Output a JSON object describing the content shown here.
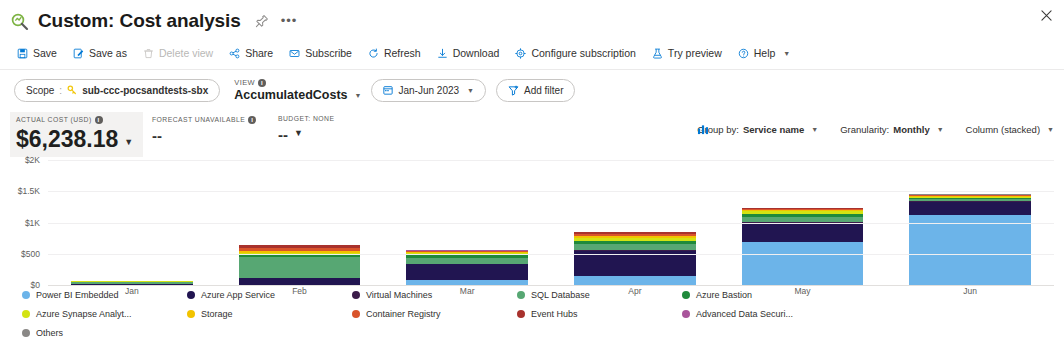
{
  "header": {
    "icon": "cost-analysis-icon",
    "title": "Custom: Cost analysis",
    "pin_icon": "pin-icon",
    "more_icon": "ellipsis-icon",
    "close_icon": "close-icon"
  },
  "command_bar": {
    "items": [
      {
        "label": "Save",
        "icon": "save-icon",
        "disabled": false,
        "caret": false
      },
      {
        "label": "Save as",
        "icon": "save-as-icon",
        "disabled": false,
        "caret": false
      },
      {
        "label": "Delete view",
        "icon": "delete-icon",
        "disabled": true,
        "caret": false
      },
      {
        "label": "Share",
        "icon": "share-icon",
        "disabled": false,
        "caret": false
      },
      {
        "label": "Subscribe",
        "icon": "mail-icon",
        "disabled": false,
        "caret": false
      },
      {
        "label": "Refresh",
        "icon": "refresh-icon",
        "disabled": false,
        "caret": false
      },
      {
        "label": "Download",
        "icon": "download-icon",
        "disabled": false,
        "caret": false
      },
      {
        "label": "Configure subscription",
        "icon": "gear-icon",
        "disabled": false,
        "caret": false
      },
      {
        "label": "Try preview",
        "icon": "beaker-icon",
        "disabled": false,
        "caret": false
      },
      {
        "label": "Help",
        "icon": "help-icon",
        "disabled": false,
        "caret": true
      }
    ]
  },
  "filter_bar": {
    "scope_label": "Scope",
    "scope_separator": ":",
    "scope_icon": "key-icon",
    "scope_value": "sub-ccc-pocsandtests-sbx",
    "view_label": "VIEW",
    "view_value": "AccumulatedCosts",
    "date_icon": "calendar-icon",
    "date_range": "Jan-Jun 2023",
    "add_filter_icon": "filter-icon",
    "add_filter_label": "Add filter"
  },
  "kpis": [
    {
      "label": "ACTUAL COST (USD)",
      "value": "$6,238.18",
      "info": true,
      "caret": true
    },
    {
      "label": "FORECAST UNAVAILABLE",
      "value": "--",
      "info": true,
      "caret": false
    },
    {
      "label": "BUDGET: NONE",
      "value": "--",
      "info": false,
      "caret": true
    }
  ],
  "chart_options": [
    {
      "prefix": "Group by:",
      "value": "Service name",
      "icon": ""
    },
    {
      "prefix": "Granularity:",
      "value": "Monthly",
      "icon": ""
    },
    {
      "prefix": "",
      "value": "Column (stacked)",
      "icon": "column-chart-icon"
    }
  ],
  "chart_data": {
    "type": "bar",
    "title": "",
    "stacked": true,
    "xlabel": "",
    "ylabel": "",
    "categories": [
      "Jan",
      "Feb",
      "Mar",
      "Apr",
      "May",
      "Jun"
    ],
    "ylim": [
      0,
      2000
    ],
    "yticks": [
      0,
      500,
      1000,
      1500,
      2000
    ],
    "ytick_labels": [
      "$0",
      "$500",
      "$1K",
      "$1.5K",
      "$2K"
    ],
    "grid": true,
    "legend_position": "bottom",
    "currency": "USD",
    "series": [
      {
        "name": "Power BI Embedded",
        "color": "#6CB4E9",
        "values": [
          0,
          0,
          80,
          150,
          690,
          1120
        ]
      },
      {
        "name": "Azure App Service",
        "color": "#211551",
        "values": [
          18,
          105,
          255,
          400,
          310,
          215
        ]
      },
      {
        "name": "Virtual Machines",
        "color": "#3B1C4A",
        "values": [
          2,
          8,
          8,
          8,
          6,
          4
        ]
      },
      {
        "name": "SQL Database",
        "color": "#57A773",
        "values": [
          24,
          330,
          95,
          95,
          88,
          35
        ]
      },
      {
        "name": "Azure Bastion",
        "color": "#1F8A3B",
        "values": [
          6,
          36,
          38,
          52,
          48,
          22
        ]
      },
      {
        "name": "Azure Synapse Analyt...",
        "color": "#D3E313",
        "values": [
          8,
          40,
          36,
          50,
          42,
          18
        ]
      },
      {
        "name": "Storage",
        "color": "#F2C300",
        "values": [
          3,
          22,
          18,
          22,
          18,
          10
        ]
      },
      {
        "name": "Container Registry",
        "color": "#D9542B",
        "values": [
          2,
          58,
          14,
          38,
          16,
          10
        ]
      },
      {
        "name": "Event Hubs",
        "color": "#A8322D",
        "values": [
          1,
          34,
          8,
          26,
          10,
          8
        ]
      },
      {
        "name": "Advanced Data Securi...",
        "color": "#A9559B",
        "values": [
          1,
          6,
          5,
          8,
          6,
          6
        ]
      },
      {
        "name": "Others",
        "color": "#8A8886",
        "values": [
          1,
          4,
          4,
          5,
          4,
          4
        ]
      }
    ]
  },
  "legend": {
    "items": [
      {
        "label": "Power BI Embedded",
        "color": "#6CB4E9"
      },
      {
        "label": "Azure App Service",
        "color": "#211551"
      },
      {
        "label": "Virtual Machines",
        "color": "#3B1C4A"
      },
      {
        "label": "SQL Database",
        "color": "#57A773"
      },
      {
        "label": "Azure Bastion",
        "color": "#1F8A3B"
      },
      {
        "label": "Azure Synapse Analyt...",
        "color": "#D3E313"
      },
      {
        "label": "Storage",
        "color": "#F2C300"
      },
      {
        "label": "Container Registry",
        "color": "#D9542B"
      },
      {
        "label": "Event Hubs",
        "color": "#A8322D"
      },
      {
        "label": "Advanced Data Securi...",
        "color": "#A9559B"
      },
      {
        "label": "Others",
        "color": "#8A8886"
      }
    ]
  },
  "colors": {
    "accent": "#0078d4",
    "text": "#323130",
    "muted": "#605e5c",
    "kpi_bg": "#f3f2f1"
  }
}
